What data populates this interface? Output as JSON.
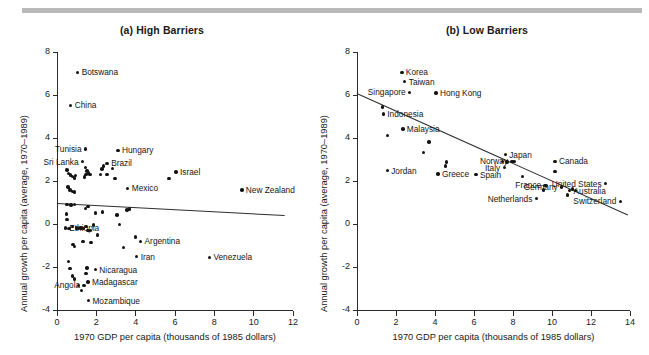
{
  "figure": {
    "xlabel": "1970 GDP per capita (thousands of 1985 dollars)",
    "ylabel": "Annual growth per capita (average, 1970–1989)"
  },
  "chart_data": [
    {
      "type": "scatter",
      "id": "panel-a",
      "title": "(a) High Barriers",
      "xlabel": "1970 GDP per capita (thousands of 1985 dollars)",
      "ylabel": "Annual growth per capita (average, 1970–1989)",
      "xlim": [
        0,
        12
      ],
      "ylim": [
        -4,
        8
      ],
      "xticks": [
        0,
        2,
        4,
        6,
        8,
        10,
        12
      ],
      "yticks": [
        -4,
        -2,
        0,
        2,
        4,
        6,
        8
      ],
      "grid": false,
      "legend": "none",
      "trendline": {
        "x1": 0.0,
        "y1": 0.98,
        "x2": 11.6,
        "y2": 0.42
      },
      "points": [
        {
          "label": "Botswana",
          "x": 1.05,
          "y": 7.05,
          "label_side": "right"
        },
        {
          "label": "China",
          "x": 0.7,
          "y": 5.52,
          "label_side": "right"
        },
        {
          "label": "Tunisia",
          "x": 1.45,
          "y": 3.48,
          "label_side": "left"
        },
        {
          "label": "Sri Lanka",
          "x": 1.3,
          "y": 2.9,
          "label_side": "left"
        },
        {
          "label": "Hungary",
          "x": 3.1,
          "y": 3.42,
          "label_side": "right"
        },
        {
          "label": "Brazil",
          "x": 2.55,
          "y": 2.82,
          "label_side": "right"
        },
        {
          "label": "Mexico",
          "x": 3.6,
          "y": 1.66,
          "label_side": "right"
        },
        {
          "label": "Israel",
          "x": 6.05,
          "y": 2.42,
          "label_side": "right"
        },
        {
          "label": "New Zealand",
          "x": 9.4,
          "y": 1.58,
          "label_side": "right"
        },
        {
          "label": "Ethiopia",
          "x": 0.42,
          "y": -0.18,
          "label_side": "right"
        },
        {
          "label": "Argentina",
          "x": 4.25,
          "y": -0.8,
          "label_side": "right"
        },
        {
          "label": "Iran",
          "x": 4.05,
          "y": -1.52,
          "label_side": "right"
        },
        {
          "label": "Venezuela",
          "x": 7.75,
          "y": -1.55,
          "label_side": "right"
        },
        {
          "label": "Nicaragua",
          "x": 1.95,
          "y": -2.12,
          "label_side": "right"
        },
        {
          "label": "Madagascar",
          "x": 1.58,
          "y": -2.7,
          "label_side": "right"
        },
        {
          "label": "Angola",
          "x": 1.38,
          "y": -2.86,
          "label_side": "left"
        },
        {
          "label": "Mozambique",
          "x": 1.6,
          "y": -3.56,
          "label_side": "right"
        },
        {
          "label": "",
          "x": 0.5,
          "y": 2.52
        },
        {
          "label": "",
          "x": 0.58,
          "y": 2.35
        },
        {
          "label": "",
          "x": 0.68,
          "y": 2.28
        },
        {
          "label": "",
          "x": 0.78,
          "y": 2.22
        },
        {
          "label": "",
          "x": 0.88,
          "y": 2.14
        },
        {
          "label": "",
          "x": 0.95,
          "y": 2.26
        },
        {
          "label": "",
          "x": 0.55,
          "y": 1.72
        },
        {
          "label": "",
          "x": 0.66,
          "y": 1.58
        },
        {
          "label": "",
          "x": 0.8,
          "y": 1.5
        },
        {
          "label": "",
          "x": 0.9,
          "y": 1.48
        },
        {
          "label": "",
          "x": 1.45,
          "y": 2.62
        },
        {
          "label": "",
          "x": 1.52,
          "y": 2.46
        },
        {
          "label": "",
          "x": 1.6,
          "y": 2.38
        },
        {
          "label": "",
          "x": 1.48,
          "y": 2.3
        },
        {
          "label": "",
          "x": 1.68,
          "y": 2.3
        },
        {
          "label": "",
          "x": 1.4,
          "y": 2.18
        },
        {
          "label": "",
          "x": 2.2,
          "y": 2.3
        },
        {
          "label": "",
          "x": 2.28,
          "y": 2.55
        },
        {
          "label": "",
          "x": 2.38,
          "y": 2.7
        },
        {
          "label": "",
          "x": 2.82,
          "y": 2.58
        },
        {
          "label": "",
          "x": 2.95,
          "y": 2.12
        },
        {
          "label": "",
          "x": 2.55,
          "y": 2.3
        },
        {
          "label": "",
          "x": 5.7,
          "y": 2.12
        },
        {
          "label": "",
          "x": 0.5,
          "y": 0.92
        },
        {
          "label": "",
          "x": 0.72,
          "y": 0.88
        },
        {
          "label": "",
          "x": 0.88,
          "y": 0.9
        },
        {
          "label": "",
          "x": 1.45,
          "y": 0.72
        },
        {
          "label": "",
          "x": 1.58,
          "y": 0.8
        },
        {
          "label": "",
          "x": 1.95,
          "y": 0.52
        },
        {
          "label": "",
          "x": 2.3,
          "y": 0.56
        },
        {
          "label": "",
          "x": 3.05,
          "y": 0.42
        },
        {
          "label": "",
          "x": 3.55,
          "y": 0.66
        },
        {
          "label": "",
          "x": 3.68,
          "y": 0.7
        },
        {
          "label": "",
          "x": 0.48,
          "y": 0.46
        },
        {
          "label": "",
          "x": 0.5,
          "y": 0.22
        },
        {
          "label": "",
          "x": 0.62,
          "y": -0.22
        },
        {
          "label": "",
          "x": 0.78,
          "y": -0.12
        },
        {
          "label": "",
          "x": 0.98,
          "y": -0.18
        },
        {
          "label": "",
          "x": 1.1,
          "y": -0.2
        },
        {
          "label": "",
          "x": 1.22,
          "y": -0.18
        },
        {
          "label": "",
          "x": 1.35,
          "y": -0.22
        },
        {
          "label": "",
          "x": 1.48,
          "y": -0.12
        },
        {
          "label": "",
          "x": 1.58,
          "y": -0.3
        },
        {
          "label": "",
          "x": 1.7,
          "y": -0.3
        },
        {
          "label": "",
          "x": 1.85,
          "y": -0.05
        },
        {
          "label": "",
          "x": 2.05,
          "y": -0.52
        },
        {
          "label": "",
          "x": 3.18,
          "y": -0.02
        },
        {
          "label": "",
          "x": 4.0,
          "y": -0.6
        },
        {
          "label": "",
          "x": 0.82,
          "y": -0.95
        },
        {
          "label": "",
          "x": 0.88,
          "y": -1.05
        },
        {
          "label": "",
          "x": 1.32,
          "y": -0.8
        },
        {
          "label": "",
          "x": 1.72,
          "y": -0.85
        },
        {
          "label": "",
          "x": 3.38,
          "y": -1.1
        },
        {
          "label": "",
          "x": 0.6,
          "y": -1.75
        },
        {
          "label": "",
          "x": 0.66,
          "y": -2.08
        },
        {
          "label": "",
          "x": 0.78,
          "y": -2.42
        },
        {
          "label": "",
          "x": 0.88,
          "y": -2.55
        },
        {
          "label": "",
          "x": 1.52,
          "y": -2.05
        },
        {
          "label": "",
          "x": 1.48,
          "y": -2.3
        },
        {
          "label": "",
          "x": 1.08,
          "y": -2.85
        },
        {
          "label": "",
          "x": 1.26,
          "y": -3.1
        }
      ]
    },
    {
      "type": "scatter",
      "id": "panel-b",
      "title": "(b) Low Barriers",
      "xlabel": "1970 GDP per capita (thousands of 1985 dollars)",
      "ylabel": "Annual growth per capita (average, 1970–1989)",
      "xlim": [
        0,
        14
      ],
      "ylim": [
        -4,
        8
      ],
      "xticks": [
        0,
        2,
        4,
        6,
        8,
        10,
        12,
        14
      ],
      "yticks": [
        -4,
        -2,
        0,
        2,
        4,
        6,
        8
      ],
      "grid": false,
      "legend": "none",
      "trendline": {
        "x1": 0.0,
        "y1": 6.1,
        "x2": 13.9,
        "y2": 0.45
      },
      "points": [
        {
          "label": "Korea",
          "x": 2.3,
          "y": 7.05,
          "label_side": "right"
        },
        {
          "label": "Taiwan",
          "x": 2.45,
          "y": 6.62,
          "label_side": "right"
        },
        {
          "label": "Singapore",
          "x": 2.7,
          "y": 6.12,
          "label_side": "left"
        },
        {
          "label": "Hong Kong",
          "x": 4.05,
          "y": 6.1,
          "label_side": "right"
        },
        {
          "label": "Indonesia",
          "x": 1.35,
          "y": 5.12,
          "label_side": "right"
        },
        {
          "label": "Malaysia",
          "x": 2.35,
          "y": 4.42,
          "label_side": "right"
        },
        {
          "label": "Jordan",
          "x": 1.55,
          "y": 2.48,
          "label_side": "right"
        },
        {
          "label": "Greece",
          "x": 4.15,
          "y": 2.32,
          "label_side": "right"
        },
        {
          "label": "Spain",
          "x": 6.1,
          "y": 2.3,
          "label_side": "right"
        },
        {
          "label": "Italy",
          "x": 7.55,
          "y": 2.62,
          "label_side": "left"
        },
        {
          "label": "Japan",
          "x": 7.6,
          "y": 3.22,
          "label_side": "right"
        },
        {
          "label": "Norway",
          "x": 7.95,
          "y": 2.92,
          "label_side": "left"
        },
        {
          "label": "Canada",
          "x": 10.15,
          "y": 2.92,
          "label_side": "right"
        },
        {
          "label": "France",
          "x": 9.65,
          "y": 1.8,
          "label_side": "left"
        },
        {
          "label": "Netherlands",
          "x": 9.2,
          "y": 1.18,
          "label_side": "left"
        },
        {
          "label": "Germany",
          "x": 10.5,
          "y": 1.72,
          "label_side": "left"
        },
        {
          "label": "United States",
          "x": 12.75,
          "y": 1.88,
          "label_side": "left"
        },
        {
          "label": "Australia",
          "x": 10.9,
          "y": 1.55,
          "label_side": "right"
        },
        {
          "label": "Switzerland",
          "x": 13.5,
          "y": 1.05,
          "label_side": "left"
        },
        {
          "label": "",
          "x": 1.3,
          "y": 5.45
        },
        {
          "label": "",
          "x": 1.55,
          "y": 4.12
        },
        {
          "label": "",
          "x": 3.4,
          "y": 3.32
        },
        {
          "label": "",
          "x": 3.7,
          "y": 3.82
        },
        {
          "label": "",
          "x": 4.6,
          "y": 2.88
        },
        {
          "label": "",
          "x": 4.55,
          "y": 2.7
        },
        {
          "label": "",
          "x": 7.45,
          "y": 2.92
        },
        {
          "label": "",
          "x": 7.7,
          "y": 2.88
        },
        {
          "label": "",
          "x": 8.05,
          "y": 2.9
        },
        {
          "label": "",
          "x": 8.5,
          "y": 2.22
        },
        {
          "label": "",
          "x": 10.15,
          "y": 2.45
        },
        {
          "label": "",
          "x": 9.7,
          "y": 1.78
        },
        {
          "label": "",
          "x": 9.55,
          "y": 1.58
        },
        {
          "label": "",
          "x": 10.8,
          "y": 1.35
        },
        {
          "label": "",
          "x": 11.05,
          "y": 1.62
        },
        {
          "label": "",
          "x": 11.2,
          "y": 1.55
        }
      ]
    }
  ]
}
